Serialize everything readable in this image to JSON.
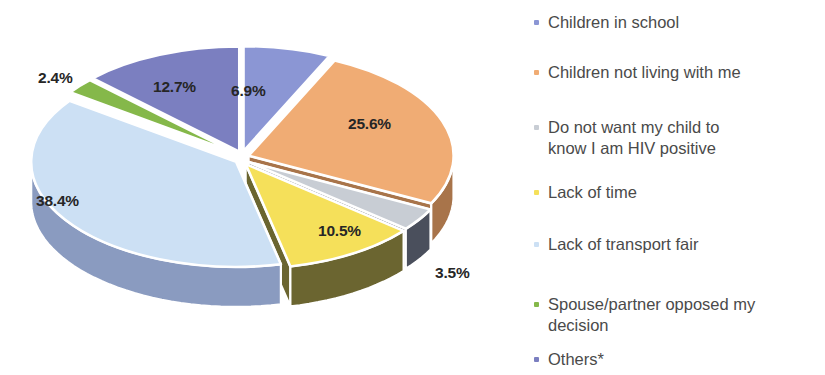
{
  "chart_data": {
    "type": "pie",
    "title": "",
    "subtitle": "",
    "xlabel": "",
    "ylabel": "",
    "style": "3d-exploded-pie",
    "legend_position": "right",
    "grid": false,
    "value_unit": "percent",
    "categories": [
      "Children in school",
      "Children not living with me",
      "Do not want my child to know I am HIV positive",
      "Lack of time",
      "Lack of transport fair",
      "Spouse/partner opposed my decision",
      "Others*"
    ],
    "values": [
      6.9,
      25.6,
      3.5,
      10.5,
      38.4,
      2.4,
      12.7
    ],
    "data_labels": [
      "6.9%",
      "25.6%",
      "3.5%",
      "10.5%",
      "38.4%",
      "2.4%",
      "12.7%"
    ],
    "colors": [
      "#8b96d4",
      "#f0ac74",
      "#c8cdd4",
      "#f5e05a",
      "#cce0f4",
      "#85b84a",
      "#7b7fc0"
    ],
    "slices": [
      {
        "label": "Children in school",
        "value": 6.9,
        "data_label": "6.9%",
        "color": "#8b96d4",
        "side_color": "#5a64a0"
      },
      {
        "label": "Children not living with me",
        "value": 25.6,
        "data_label": "25.6%",
        "color": "#f0ac74",
        "side_color": "#a8744a"
      },
      {
        "label": "Do not want my child to know I am HIV positive",
        "value": 3.5,
        "data_label": "3.5%",
        "color": "#c8cdd4",
        "side_color": "#4a4f5c"
      },
      {
        "label": "Lack of time",
        "value": 10.5,
        "data_label": "10.5%",
        "color": "#f5e05a",
        "side_color": "#6b6530"
      },
      {
        "label": "Lack of transport fair",
        "value": 38.4,
        "data_label": "38.4%",
        "color": "#cce0f4",
        "side_color": "#8a9bc0"
      },
      {
        "label": "Spouse/partner opposed my decision",
        "value": 2.4,
        "data_label": "2.4%",
        "color": "#85b84a",
        "side_color": "#5a7d30"
      },
      {
        "label": "Others*",
        "value": 12.7,
        "data_label": "12.7%",
        "color": "#7b7fc0",
        "side_color": "#50538a"
      }
    ]
  },
  "legend": {
    "items": [
      {
        "label": "Children in school",
        "marker_color": "#8b96d4"
      },
      {
        "label": "Children not living with me",
        "marker_color": "#f0ac74"
      },
      {
        "label": "Do not want my child to\nknow I am HIV positive",
        "marker_color": "#c8cdd4"
      },
      {
        "label": "Lack of time",
        "marker_color": "#f5e05a"
      },
      {
        "label": "Lack of transport fair",
        "marker_color": "#cce0f4"
      },
      {
        "label": "Spouse/partner opposed my\ndecision",
        "marker_color": "#85b84a"
      },
      {
        "label": "Others*",
        "marker_color": "#7b7fc0"
      }
    ]
  },
  "labels": {
    "pct_6_9": "6.9%",
    "pct_25_6": "25.6%",
    "pct_3_5": "3.5%",
    "pct_10_5": "10.5%",
    "pct_38_4": "38.4%",
    "pct_2_4": "2.4%",
    "pct_12_7": "12.7%"
  }
}
